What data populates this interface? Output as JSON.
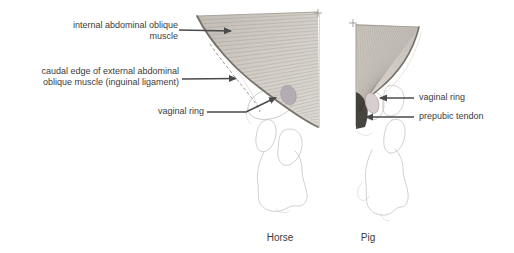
{
  "figure": {
    "left_panel": {
      "caption": "Horse",
      "labels": {
        "internal_oblique": "internal abdominal oblique muscle",
        "caudal_edge": "caudal edge of external abdominal oblique muscle (inguinal ligament)",
        "vaginal_ring": "vaginal ring"
      }
    },
    "right_panel": {
      "caption": "Pig",
      "labels": {
        "vaginal_ring": "vaginal ring",
        "prepubic_tendon": "prepubic tendon"
      }
    },
    "colors": {
      "muscle_fiber": "#8f8a83",
      "muscle_edge": "#6a645d",
      "tendon_dark": "#38342f",
      "vaginal_ring_horse": "#b0a7b0",
      "vaginal_ring_pig": "#d8cecf",
      "bone_outline": "#c8c4be",
      "arrow": "#4a4a4a",
      "text": "#3b3b3b"
    }
  }
}
